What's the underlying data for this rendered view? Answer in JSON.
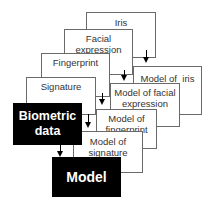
{
  "diagram": {
    "inputs": [
      {
        "label": "Iris"
      },
      {
        "label": "Facial\nexpression"
      },
      {
        "label": "Fingerprint"
      },
      {
        "label": "Signature"
      }
    ],
    "source": {
      "label": "Biometric\ndata",
      "color": "#000000"
    },
    "models": [
      {
        "label": "Model of  iris"
      },
      {
        "label": "Model of  facial\nexpression"
      },
      {
        "label": "Model of\nfingerprint"
      },
      {
        "label": "Model of\nsignature"
      }
    ],
    "output": {
      "label": "Model",
      "color": "#000000"
    }
  }
}
